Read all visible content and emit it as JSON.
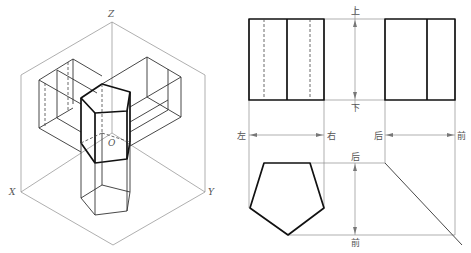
{
  "isometric": {
    "axis_labels": {
      "z": "Z",
      "x": "X",
      "y": "Y",
      "origin": "O"
    }
  },
  "orthographic": {
    "front_view_labels": {
      "top": "上",
      "bottom": "下",
      "left": "左",
      "right": "右"
    },
    "side_view_labels": {
      "back": "后",
      "front": "前"
    },
    "top_view_labels": {
      "back": "后",
      "front": "前"
    }
  },
  "colors": {
    "line_bold": "#111111",
    "line_thin": "#8c8c8c"
  }
}
